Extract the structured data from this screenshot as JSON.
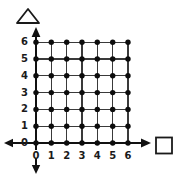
{
  "diagram": {
    "type": "lattice-grid",
    "grid": {
      "x_min": 0,
      "x_max": 6,
      "y_min": 0,
      "y_max": 6,
      "step": 1,
      "dot_count": 49,
      "line_color": "#1a1a1a",
      "dot_color": "#0d0d0d",
      "background": "#ffffff"
    },
    "axes": {
      "x_label": "",
      "y_label": "",
      "x_ticks": [
        "0",
        "1",
        "2",
        "3",
        "4",
        "5",
        "6"
      ],
      "y_ticks": [
        "0",
        "1",
        "2",
        "3",
        "4",
        "5",
        "6"
      ],
      "arrows": [
        {
          "name": "up-arrow",
          "direction": "up"
        },
        {
          "name": "right-arrow",
          "direction": "right"
        },
        {
          "name": "left-arrow",
          "direction": "left"
        },
        {
          "name": "down-arrow",
          "direction": "down"
        }
      ]
    },
    "markers": [
      {
        "name": "triangle-marker",
        "shape": "triangle",
        "position": "above-y-axis",
        "fill": "none",
        "stroke": "#1a1a1a"
      },
      {
        "name": "square-marker",
        "shape": "square",
        "position": "right-of-x-axis",
        "fill": "none",
        "stroke": "#1a1a1a"
      }
    ]
  }
}
